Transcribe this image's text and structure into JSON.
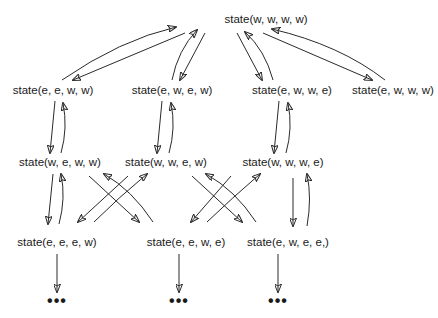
{
  "diagram": {
    "type": "state-transition-graph",
    "colors": {
      "stroke": "#2a2a2a",
      "text": "#1a1a1a",
      "background": "#ffffff"
    },
    "nodes": [
      {
        "id": "n0",
        "label": "state(w, w, w, w)",
        "x": 266,
        "y": 20
      },
      {
        "id": "n1",
        "label": "state(e, e, w, w)",
        "x": 53,
        "y": 91
      },
      {
        "id": "n2",
        "label": "state(e, w, e, w)",
        "x": 172,
        "y": 91
      },
      {
        "id": "n3",
        "label": "state(e, w, w, e)",
        "x": 292,
        "y": 91
      },
      {
        "id": "n4",
        "label": "state(e, w, w, w)",
        "x": 393,
        "y": 91
      },
      {
        "id": "n5",
        "label": "state(w, e, w, w)",
        "x": 60,
        "y": 163
      },
      {
        "id": "n6",
        "label": "state(w, w, e, w)",
        "x": 166,
        "y": 163
      },
      {
        "id": "n7",
        "label": "state(w, w, w, e)",
        "x": 283,
        "y": 163
      },
      {
        "id": "n8",
        "label": "state(e, e, e, w)",
        "x": 57,
        "y": 243
      },
      {
        "id": "n9",
        "label": "state(e, e, w, e)",
        "x": 186,
        "y": 243
      },
      {
        "id": "n10",
        "label": "state(e, w, e, e,)",
        "x": 288,
        "y": 243
      }
    ],
    "ellipses": [
      {
        "id": "d1",
        "label": "•••",
        "x": 57,
        "y": 301
      },
      {
        "id": "d2",
        "label": "•••",
        "x": 179,
        "y": 301
      },
      {
        "id": "d3",
        "label": "•••",
        "x": 278,
        "y": 301
      }
    ],
    "edges": [
      {
        "from": "n1",
        "to": "n0"
      },
      {
        "from": "n0",
        "to": "n1"
      },
      {
        "from": "n2",
        "to": "n0"
      },
      {
        "from": "n0",
        "to": "n2"
      },
      {
        "from": "n3",
        "to": "n0"
      },
      {
        "from": "n0",
        "to": "n3"
      },
      {
        "from": "n4",
        "to": "n0"
      },
      {
        "from": "n0",
        "to": "n4"
      },
      {
        "from": "n1",
        "to": "n5"
      },
      {
        "from": "n5",
        "to": "n1"
      },
      {
        "from": "n2",
        "to": "n6"
      },
      {
        "from": "n6",
        "to": "n2"
      },
      {
        "from": "n3",
        "to": "n7"
      },
      {
        "from": "n7",
        "to": "n3"
      },
      {
        "from": "n5",
        "to": "n8"
      },
      {
        "from": "n8",
        "to": "n5"
      },
      {
        "from": "n5",
        "to": "n9"
      },
      {
        "from": "n9",
        "to": "n5"
      },
      {
        "from": "n6",
        "to": "n8"
      },
      {
        "from": "n8",
        "to": "n6"
      },
      {
        "from": "n6",
        "to": "n10"
      },
      {
        "from": "n10",
        "to": "n6"
      },
      {
        "from": "n7",
        "to": "n9"
      },
      {
        "from": "n9",
        "to": "n7"
      },
      {
        "from": "n7",
        "to": "n10"
      },
      {
        "from": "n10",
        "to": "n7"
      },
      {
        "from": "n8",
        "to": "d1"
      },
      {
        "from": "n9",
        "to": "d2"
      },
      {
        "from": "n10",
        "to": "d3"
      }
    ]
  }
}
